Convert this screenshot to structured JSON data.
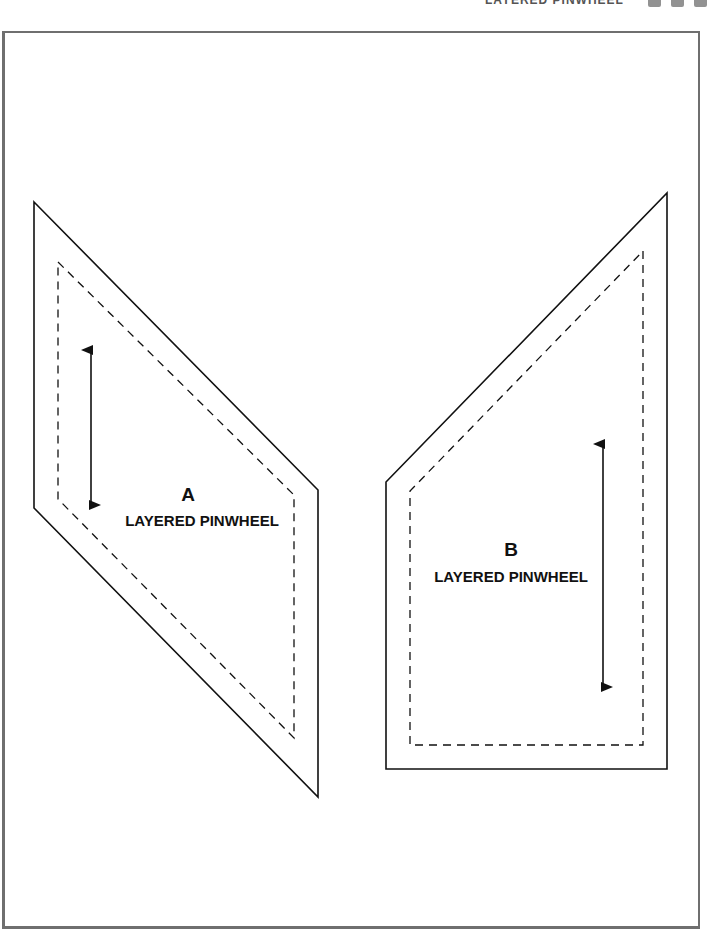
{
  "header": {
    "title": "LAYERED PINWHEEL",
    "icons": [
      "square-icon",
      "square-icon",
      "square-icon"
    ]
  },
  "pieces": [
    {
      "id": "A",
      "letter": "A",
      "name": "LAYERED PINWHEEL",
      "cut_line_points": "34,202 318,490 318,797 34,508",
      "sew_line_points": "58,262 294,495 294,738 58,499",
      "grain_arrow": {
        "x": 91,
        "y1": 350,
        "y2": 505
      },
      "label_pos": {
        "x": 188,
        "letter_y": 484,
        "name_y": 512
      }
    },
    {
      "id": "B",
      "letter": "B",
      "name": "LAYERED PINWHEEL",
      "cut_line_points": "667,193 667,769 386,769 386,482",
      "sew_line_points": "643,251 643,745 410,745 410,491",
      "grain_arrow": {
        "x": 603,
        "y1": 444,
        "y2": 687
      },
      "label_pos": {
        "x": 511,
        "letter_y": 539,
        "name_y": 568
      }
    }
  ],
  "colors": {
    "line": "#111111",
    "frame": "#6f6f6f"
  }
}
